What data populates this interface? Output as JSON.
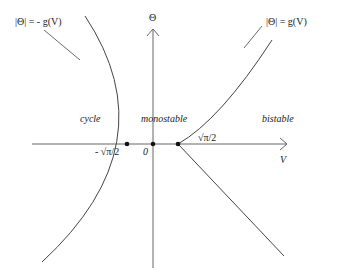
{
  "diagram": {
    "axes": {
      "x_label": "V",
      "y_label": "Θ",
      "origin_label": "0"
    },
    "curves": [
      {
        "name": "left-boundary",
        "equation": "|Θ| = - g(V)"
      },
      {
        "name": "right-boundary",
        "equation": "|Θ| = g(V)"
      }
    ],
    "regions": [
      "cycle",
      "monostable",
      "bistable"
    ],
    "points": [
      {
        "label": "- √π/2"
      },
      {
        "label": "0"
      },
      {
        "label": "√π/2"
      }
    ]
  },
  "labels": {
    "left_eq": "|Θ| = - g(V)",
    "right_eq": "|Θ| = g(V)",
    "theta": "Θ",
    "v": "V",
    "zero": "0",
    "neg_root": "- √π/2",
    "pos_root": "√π/2",
    "cycle": "cycle",
    "monostable": "monostable",
    "bistable": "bistable"
  }
}
